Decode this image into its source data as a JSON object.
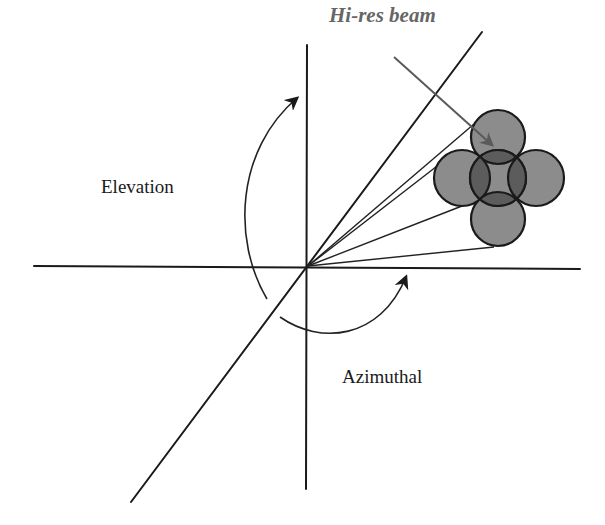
{
  "diagram": {
    "labels": {
      "hires_beam": "Hi-res beam",
      "elevation": "Elevation",
      "azimuthal": "Azimuthal"
    },
    "colors": {
      "axis": "#1a1a1a",
      "beam_fill": "#8c8c8c",
      "beam_overlap": "#5c5c5c",
      "label_hires": "#666666",
      "pointer": "#5a5a5a"
    },
    "origin": [
      308,
      267
    ],
    "beams": [
      {
        "name": "top",
        "cx": 498,
        "cy": 137,
        "r": 27
      },
      {
        "name": "left",
        "cx": 462,
        "cy": 178,
        "r": 28
      },
      {
        "name": "right",
        "cx": 536,
        "cy": 178,
        "r": 28
      },
      {
        "name": "bottom",
        "cx": 498,
        "cy": 219,
        "r": 27
      },
      {
        "name": "center",
        "cx": 498,
        "cy": 178,
        "r": 28
      }
    ]
  }
}
